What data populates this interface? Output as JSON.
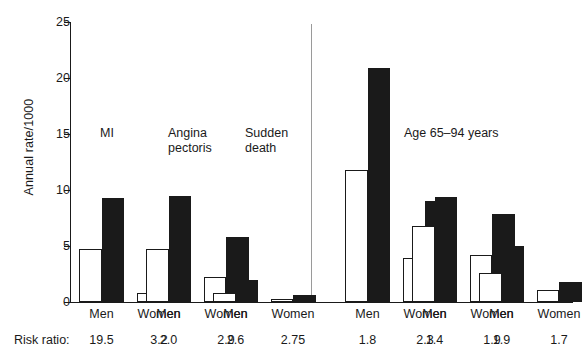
{
  "chart_data": {
    "type": "bar",
    "title": "",
    "xlabel": "",
    "ylabel": "Annual rate/1000",
    "ylim": [
      0,
      25
    ],
    "yticks": [
      0,
      5,
      10,
      15,
      20,
      25
    ],
    "grid": false,
    "legend_position": "none",
    "panels": [
      {
        "name": "left-panel",
        "annotations": [
          "MI",
          "Angina\npectoris",
          "Sudden\ndeath"
        ],
        "categories": [
          "Men",
          "Women",
          "Men",
          "Women",
          "Men",
          "Women"
        ],
        "series": [
          {
            "name": "open",
            "values": [
              4.7,
              0.8,
              4.7,
              2.2,
              0.8,
              0.25
            ]
          },
          {
            "name": "solid",
            "values": [
              9.3,
              2.9,
              9.5,
              5.8,
              2.0,
              0.6
            ]
          }
        ],
        "risk_ratios": [
          "19.5",
          "3.2",
          "2.0",
          "2.9",
          "2.6",
          "2.75"
        ]
      },
      {
        "name": "right-panel",
        "annotations": [
          "Age 65–94 years"
        ],
        "categories": [
          "Men",
          "Women",
          "Men",
          "Women",
          "Men",
          "Women"
        ],
        "series": [
          {
            "name": "open",
            "values": [
              11.8,
              3.9,
              6.8,
              4.2,
              2.6,
              1.1
            ]
          },
          {
            "name": "solid",
            "values": [
              20.9,
              9.0,
              9.4,
              7.9,
              5.0,
              1.8
            ]
          }
        ],
        "risk_ratios": [
          "1.8",
          "2.3",
          "1.4",
          "1.9",
          "1.9",
          "1.7"
        ]
      }
    ]
  },
  "axis": {
    "y_label": "Annual rate/1000",
    "y_ticks": [
      "0",
      "5",
      "10",
      "15",
      "20",
      "25"
    ]
  },
  "annotations": {
    "mi": "MI",
    "angina": "Angina\npectoris",
    "sudden_death": "Sudden\ndeath",
    "age_range": "Age 65–94 years"
  },
  "categories": {
    "men": "Men",
    "women": "Women"
  },
  "risk_ratio": {
    "label": "Risk ratio:",
    "values": [
      "19.5",
      "3.2",
      "2.0",
      "2.9",
      "2.6",
      "2.75",
      "1.8",
      "2.3",
      "1.4",
      "1.9",
      "1.9",
      "1.7"
    ]
  },
  "colors": {
    "solid_bar": "#1a1a1a",
    "open_bar": "#ffffff",
    "axis": "#1a1a1a",
    "divider": "#9a9a9a",
    "background": "#ffffff"
  }
}
